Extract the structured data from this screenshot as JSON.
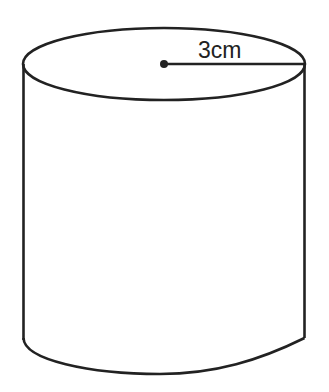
{
  "figure": {
    "type": "cylinder",
    "stroke_color": "#222222",
    "background": "#ffffff",
    "radius_label": "3cm",
    "elements": [
      "top-ellipse",
      "left-side-line",
      "right-side-line",
      "bottom-curve",
      "center-point",
      "radius-line",
      "radius-label"
    ]
  }
}
